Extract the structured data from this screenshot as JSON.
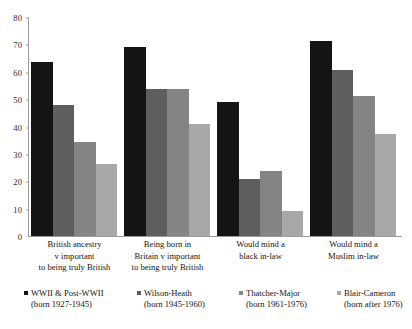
{
  "chart_data": {
    "type": "bar",
    "title": "",
    "subtitle": "",
    "xlabel": "",
    "ylabel": "",
    "ylim": [
      0,
      80
    ],
    "ytick_step": 10,
    "yticks": [
      0,
      10,
      20,
      30,
      40,
      50,
      60,
      70,
      80
    ],
    "grid": false,
    "legend_position": "bottom",
    "categories": [
      "British ancestry\nv important\nto being truly British",
      "Being born in\nBritain v important\nto being truly British",
      "Would mind a\nblack in-law",
      "Would mind a\nMuslim in-law"
    ],
    "series": [
      {
        "name": "WWII & Post-WWII",
        "sub": "(born 1927-1945)",
        "color": "#141414",
        "values": [
          64,
          69.5,
          49,
          71.5
        ]
      },
      {
        "name": "Wilson-Heath",
        "sub": "(born 1945-1960)",
        "color": "#5e5e5e",
        "values": [
          48,
          54,
          21,
          61
        ]
      },
      {
        "name": "Thatcher-Major",
        "sub": "(born 1961-1976)",
        "color": "#848484",
        "values": [
          34.5,
          54,
          24,
          51.5
        ]
      },
      {
        "name": "Blair-Cameron",
        "sub": "(born after 1976)",
        "color": "#a8a8a8",
        "values": [
          26.5,
          41,
          9,
          37.5
        ]
      }
    ]
  },
  "axis": {
    "line_color": "#9a9a9a"
  }
}
